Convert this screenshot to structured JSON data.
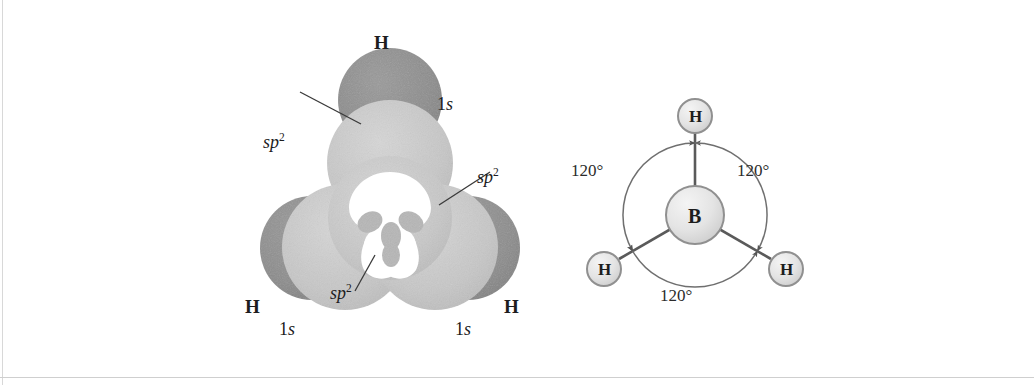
{
  "figure": {
    "colors": {
      "hydrogen_lobe": "#8e8e8e",
      "sp2_lobe": "#c9c9c9",
      "back_lobe": "#bdbdbd",
      "leader_line": "#3a3a3a",
      "atom_outline": "#8a8a8a",
      "atom_fill": "#e2e2e2",
      "bond": "#555555",
      "arc": "#6f6f6f",
      "text": "#1d1d1d"
    }
  },
  "orbital_panel": {
    "name": "sp2-hybrid-orbital-overlap-diagram",
    "hydrogen_labels": [
      {
        "id": "h-top",
        "atom": "H",
        "orbital_main": "1",
        "orbital_sub": "s"
      },
      {
        "id": "h-left",
        "atom": "H",
        "orbital_main": "1",
        "orbital_sub": "s"
      },
      {
        "id": "h-right",
        "atom": "H",
        "orbital_main": "1",
        "orbital_sub": "s"
      }
    ],
    "hybrid_labels": [
      {
        "id": "sp2-upper-left",
        "text": "sp",
        "exponent": "2"
      },
      {
        "id": "sp2-right",
        "text": "sp",
        "exponent": "2"
      },
      {
        "id": "sp2-bottom",
        "text": "sp",
        "exponent": "2"
      }
    ]
  },
  "geometry_panel": {
    "name": "trigonal-planar-bond-angle-diagram",
    "central_atom": "B",
    "terminal_atoms": [
      "H",
      "H",
      "H"
    ],
    "bond_angles": [
      {
        "id": "angle-upper-left",
        "value": "120°"
      },
      {
        "id": "angle-upper-right",
        "value": "120°"
      },
      {
        "id": "angle-bottom",
        "value": "120°"
      }
    ]
  }
}
